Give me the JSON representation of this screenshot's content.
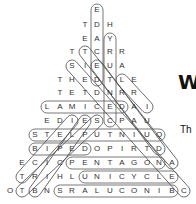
{
  "puzzle": {
    "rows": [
      {
        "y": 10,
        "cells": [
          [
            "E",
            97
          ]
        ]
      },
      {
        "y": 25,
        "cells": [
          [
            "T",
            85
          ],
          [
            "D",
            97
          ],
          [
            "H",
            110
          ]
        ]
      },
      {
        "y": 39,
        "cells": [
          [
            "E",
            85
          ],
          [
            "A",
            97
          ],
          [
            "Y",
            110
          ]
        ]
      },
      {
        "y": 52,
        "cells": [
          [
            "T",
            72
          ],
          [
            "T",
            85
          ],
          [
            "C",
            97
          ],
          [
            "R",
            110
          ],
          [
            "R",
            122
          ]
        ]
      },
      {
        "y": 66,
        "cells": [
          [
            "S",
            72
          ],
          [
            "I",
            85
          ],
          [
            "E",
            97
          ],
          [
            "U",
            110
          ],
          [
            "A",
            122
          ]
        ]
      },
      {
        "y": 80,
        "cells": [
          [
            "T",
            60
          ],
          [
            "H",
            72
          ],
          [
            "E",
            85
          ],
          [
            "D",
            97
          ],
          [
            "T",
            110
          ],
          [
            "L",
            122
          ],
          [
            "E",
            134
          ]
        ]
      },
      {
        "y": 93,
        "cells": [
          [
            "T",
            60
          ],
          [
            "E",
            72
          ],
          [
            "T",
            85
          ],
          [
            "D",
            97
          ],
          [
            "N",
            110
          ],
          [
            "R",
            122
          ],
          [
            "R",
            134
          ]
        ]
      },
      {
        "y": 107,
        "cells": [
          [
            "L",
            47
          ],
          [
            "A",
            60
          ],
          [
            "M",
            72
          ],
          [
            "I",
            85
          ],
          [
            "C",
            97
          ],
          [
            "E",
            110
          ],
          [
            "D",
            122
          ],
          [
            "A",
            134
          ],
          [
            "I",
            147
          ]
        ]
      },
      {
        "y": 121,
        "cells": [
          [
            "E",
            47
          ],
          [
            "D",
            60
          ],
          [
            "I",
            72
          ],
          [
            "E",
            85
          ],
          [
            "S",
            97
          ],
          [
            "C",
            110
          ],
          [
            "P",
            122
          ],
          [
            "A",
            134
          ],
          [
            "U",
            147
          ]
        ]
      },
      {
        "y": 135,
        "cells": [
          [
            "S",
            35
          ],
          [
            "T",
            47
          ],
          [
            "E",
            60
          ],
          [
            "L",
            72
          ],
          [
            "P",
            85
          ],
          [
            "U",
            97
          ],
          [
            "T",
            110
          ],
          [
            "N",
            122
          ],
          [
            "I",
            134
          ],
          [
            "U",
            147
          ],
          [
            "Q",
            159
          ]
        ]
      },
      {
        "y": 149,
        "cells": [
          [
            "B",
            35
          ],
          [
            "I",
            47
          ],
          [
            "P",
            60
          ],
          [
            "E",
            72
          ],
          [
            "D",
            85
          ],
          [
            "O",
            97
          ],
          [
            "P",
            110
          ],
          [
            "I",
            122
          ],
          [
            "R",
            134
          ],
          [
            "T",
            147
          ],
          [
            "D",
            159
          ]
        ]
      },
      {
        "y": 163,
        "cells": [
          [
            "E",
            22
          ],
          [
            "C",
            35
          ],
          [
            "I",
            47
          ],
          [
            "C",
            60
          ],
          [
            "P",
            72
          ],
          [
            "E",
            85
          ],
          [
            "N",
            97
          ],
          [
            "T",
            110
          ],
          [
            "A",
            122
          ],
          [
            "G",
            134
          ],
          [
            "O",
            147
          ],
          [
            "N",
            159
          ],
          [
            "A",
            172
          ]
        ]
      },
      {
        "y": 177,
        "cells": [
          [
            "T",
            22
          ],
          [
            "R",
            35
          ],
          [
            "I",
            47
          ],
          [
            "H",
            60
          ],
          [
            "L",
            72
          ],
          [
            "U",
            85
          ],
          [
            "N",
            97
          ],
          [
            "I",
            110
          ],
          [
            "C",
            122
          ],
          [
            "Y",
            134
          ],
          [
            "C",
            147
          ],
          [
            "L",
            159
          ],
          [
            "E",
            172
          ]
        ]
      },
      {
        "y": 191,
        "cells": [
          [
            "O",
            10
          ],
          [
            "T",
            22
          ],
          [
            "B",
            35
          ],
          [
            "N",
            47
          ],
          [
            "S",
            60
          ],
          [
            "R",
            72
          ],
          [
            "A",
            85
          ],
          [
            "L",
            97
          ],
          [
            "U",
            110
          ],
          [
            "C",
            122
          ],
          [
            "O",
            134
          ],
          [
            "N",
            147
          ],
          [
            "I",
            159
          ],
          [
            "B",
            172
          ],
          [
            "C",
            184
          ]
        ]
      }
    ],
    "found_words": [
      {
        "word": "DECADE",
        "x1": 97,
        "y1": 10,
        "x2": 97,
        "y2": 80
      },
      {
        "word": "CENTURY",
        "x1": 110,
        "y1": 39,
        "x2": 110,
        "y2": 121
      },
      {
        "word": "DECIMAL",
        "x1": 47,
        "y1": 107,
        "x2": 122,
        "y2": 107
      },
      {
        "word": "QUINTUPLETS",
        "x1": 35,
        "y1": 135,
        "x2": 159,
        "y2": 135
      },
      {
        "word": "BIPED",
        "x1": 35,
        "y1": 149,
        "x2": 85,
        "y2": 149
      },
      {
        "word": "PENTAGON",
        "x1": 72,
        "y1": 163,
        "x2": 159,
        "y2": 163
      },
      {
        "word": "UNICYCLE",
        "x1": 85,
        "y1": 177,
        "x2": 172,
        "y2": 177
      },
      {
        "word": "BINOCULARS",
        "x1": 60,
        "y1": 191,
        "x2": 172,
        "y2": 191
      },
      {
        "word": "diag-1",
        "x1": 72,
        "y1": 66,
        "x2": 184,
        "y2": 191
      },
      {
        "word": "diag-2",
        "x1": 85,
        "y1": 52,
        "x2": 172,
        "y2": 163
      },
      {
        "word": "diag-3",
        "x1": 97,
        "y1": 66,
        "x2": 159,
        "y2": 149
      },
      {
        "word": "diag-4",
        "x1": 122,
        "y1": 80,
        "x2": 147,
        "y2": 107
      },
      {
        "word": "diag-5",
        "x1": 97,
        "y1": 121,
        "x2": 22,
        "y2": 191
      },
      {
        "word": "diag-6",
        "x1": 85,
        "y1": 121,
        "x2": 35,
        "y2": 191
      },
      {
        "word": "diag-7",
        "x1": 72,
        "y1": 121,
        "x2": 22,
        "y2": 177
      }
    ]
  },
  "side_text": {
    "heading_fragment": "W",
    "body_fragment": "Th"
  }
}
